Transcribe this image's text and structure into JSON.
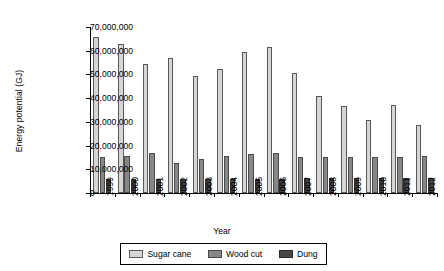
{
  "chart_data": {
    "type": "bar",
    "title": "",
    "xlabel": "Year",
    "ylabel": "Energy potential (GJ)",
    "ylim": [
      0,
      70000000
    ],
    "ytick_step": 10000000,
    "ytick_labels": [
      "0",
      "10,000,000",
      "20,000,000",
      "30,000,000",
      "40,000,000",
      "50,000,000",
      "60,000,000",
      "70,000,000"
    ],
    "ytick_values": [
      0,
      10000000,
      20000000,
      30000000,
      40000000,
      50000000,
      60000000,
      70000000
    ],
    "grid": false,
    "legend_position": "bottom",
    "categories": [
      "1999",
      "2000",
      "2001",
      "2002",
      "2003",
      "2004",
      "2005",
      "2006",
      "2007",
      "2008",
      "2009",
      "2010",
      "2011",
      "2012"
    ],
    "series": [
      {
        "name": "Sugar cane",
        "color": "#d6d6d6",
        "values": [
          66000000,
          63000000,
          54500000,
          57000000,
          49500000,
          52500000,
          59500000,
          61500000,
          50500000,
          41000000,
          36500000,
          31000000,
          37000000,
          28500000
        ]
      },
      {
        "name": "Wood cut",
        "color": "#878787",
        "values": [
          15000000,
          15800000,
          16800000,
          12500000,
          14500000,
          15500000,
          16300000,
          17000000,
          15300000,
          15300000,
          15300000,
          15300000,
          15300000,
          15800000
        ]
      },
      {
        "name": "Dung",
        "color": "#474747",
        "values": [
          6000000,
          6100000,
          6100000,
          6000000,
          5800000,
          6000000,
          6100000,
          6100000,
          6200000,
          6200000,
          6200000,
          6300000,
          6300000,
          6300000
        ]
      }
    ]
  }
}
